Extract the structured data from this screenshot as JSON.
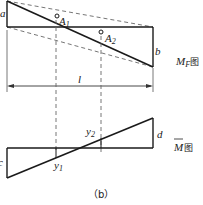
{
  "diagram": {
    "caption": "（b）",
    "mf_diagram": {
      "title_main": "M",
      "title_sub": "F",
      "title_suffix": "图",
      "left_value_label": "a",
      "right_value_label": "b",
      "span_label": "l",
      "points": [
        {
          "label_main": "A",
          "label_sub": "1"
        },
        {
          "label_main": "A",
          "label_sub": "2"
        }
      ]
    },
    "m_bar_diagram": {
      "title_main": "M",
      "title_suffix": "图",
      "left_value_label": "c",
      "right_value_label": "d",
      "ordinates": [
        {
          "label_main": "y",
          "label_sub": "1"
        },
        {
          "label_main": "y",
          "label_sub": "2"
        }
      ]
    }
  },
  "colors": {
    "line": "#1a1a1a",
    "dashed": "#666666",
    "background": "#ffffff"
  }
}
